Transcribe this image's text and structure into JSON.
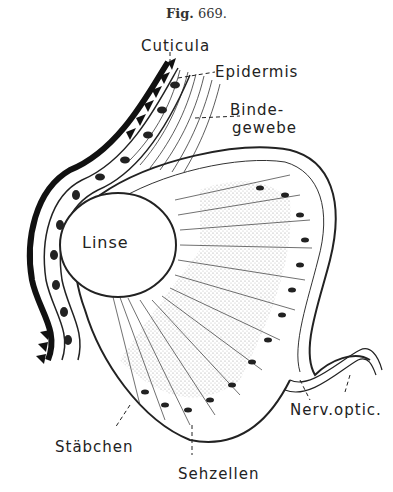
{
  "figure": {
    "title_prefix": "Fig.",
    "number": "669."
  },
  "labels": {
    "cuticula": "Cuticula",
    "epidermis": "Epidermis",
    "bindegewebe_line1": "Binde-",
    "bindegewebe_line2": "gewebe",
    "linse": "Linse",
    "nerv_optic": "Nerv.optic.",
    "staebchen": "Stäbchen",
    "sehzellen": "Sehzellen"
  },
  "colors": {
    "ink": "#222222",
    "background": "#ffffff"
  }
}
